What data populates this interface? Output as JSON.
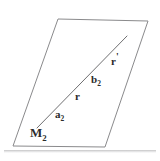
{
  "figure": {
    "background_color": "#ffffff",
    "stroke_color": "#8a8a8c",
    "label_color": "#2b2b2b",
    "canvas": {
      "width": 160,
      "height": 161
    },
    "shapes": {
      "parallelogram": {
        "name": "parallelogram-outline",
        "points": "58,19 148,21 105,147 13,146",
        "stroke_width": 1
      },
      "diagonal": {
        "name": "diagonal-line",
        "x1": 37,
        "y1": 128,
        "x2": 127,
        "y2": 36,
        "stroke_width": 1
      }
    },
    "labels": [
      {
        "id": "M2",
        "base": "M",
        "sub": "2",
        "prime": "",
        "x": 30,
        "y": 126
      },
      {
        "id": "a2",
        "base": "a",
        "sub": "2",
        "prime": "",
        "x": 55,
        "y": 109
      },
      {
        "id": "r",
        "base": "r",
        "sub": "",
        "prime": "",
        "x": 75,
        "y": 91
      },
      {
        "id": "b2",
        "base": "b",
        "sub": "2",
        "prime": "",
        "x": 91,
        "y": 74
      },
      {
        "id": "rp",
        "base": "r",
        "sub": "",
        "prime": "'",
        "x": 111,
        "y": 52
      }
    ],
    "label_text": {
      "M2_base": "M",
      "M2_sub": "2",
      "a2_base": "a",
      "a2_sub": "2",
      "r_base": "r",
      "b2_base": "b",
      "b2_sub": "2",
      "rp_base": "r",
      "rp_prime": "'"
    }
  }
}
